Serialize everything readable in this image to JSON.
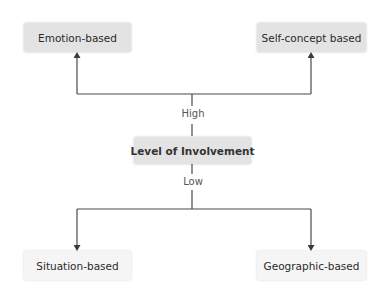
{
  "diagram": {
    "type": "hierarchy",
    "center": {
      "label": "Level of Involvement"
    },
    "branches": {
      "high": {
        "label": "High",
        "nodes": [
          {
            "label": "Emotion-based"
          },
          {
            "label": "Self-concept based"
          }
        ]
      },
      "low": {
        "label": "Low",
        "nodes": [
          {
            "label": "Situation-based"
          },
          {
            "label": "Geographic-based"
          }
        ]
      }
    },
    "colors": {
      "high_box_fill": "#e3e3e3",
      "center_box_fill": "#e3e3e3",
      "low_box_fill": "#f5f5f5",
      "line": "#4a4a4a"
    }
  }
}
